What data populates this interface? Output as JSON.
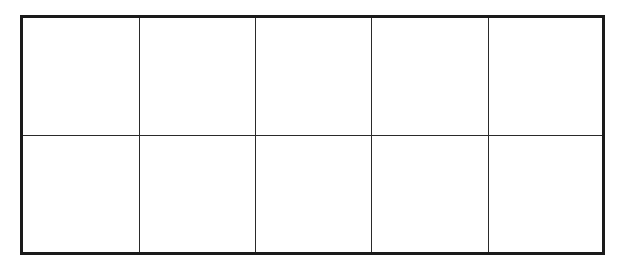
{
  "diagram": {
    "type": "grid",
    "rows": 2,
    "columns": 5,
    "cells": [
      [
        "",
        "",
        "",
        "",
        ""
      ],
      [
        "",
        "",
        "",
        "",
        ""
      ]
    ],
    "colors": {
      "line": "#1a1a1a",
      "background": "#ffffff"
    }
  }
}
